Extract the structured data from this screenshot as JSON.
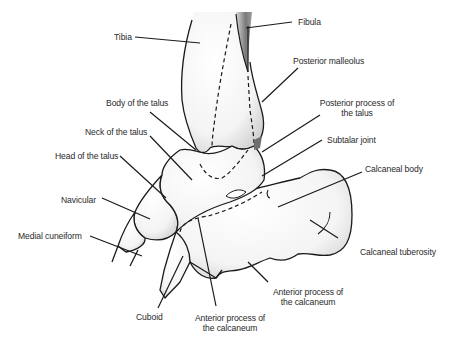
{
  "diagram": {
    "colors": {
      "outline": "#1a1a1a",
      "bone_fill": "#f7f7f7",
      "shade": "#cfcfcf",
      "fibula_shade": "#6e6e6e",
      "text": "#2a2a2a"
    },
    "labels": {
      "tibia": "Tibia",
      "fibula": "Fibula",
      "posterior_malleolus": "Posterior malleolus",
      "body_of_talus": "Body of the talus",
      "posterior_process_talus_1": "Posterior process of",
      "posterior_process_talus_2": "the talus",
      "neck_of_talus": "Neck of the talus",
      "subtalar_joint": "Subtalar joint",
      "head_of_talus": "Head of the talus",
      "calcaneal_body": "Calcaneal body",
      "navicular": "Navicular",
      "medial_cuneiform": "Medial cuneiform",
      "calcaneal_tuberosity": "Calcaneal tuberosity",
      "anterior_process_calcaneum_right_1": "Anterior process of",
      "anterior_process_calcaneum_right_2": "the calcaneum",
      "cuboid": "Cuboid",
      "anterior_process_calcaneum_bottom_1": "Anterior process of",
      "anterior_process_calcaneum_bottom_2": "the calcaneum"
    }
  }
}
